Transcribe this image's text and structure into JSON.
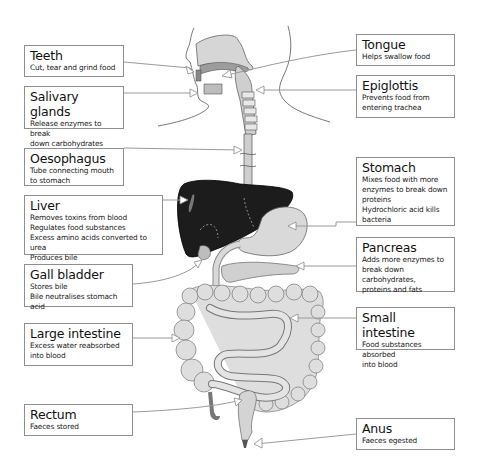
{
  "diagram": {
    "labels": [
      {
        "id": "teeth",
        "side": "left",
        "title": "Teeth",
        "description": [
          "Cut, tear and grind food"
        ],
        "box": {
          "x": 24,
          "y": 45,
          "w": 100,
          "h": 32
        }
      },
      {
        "id": "salivary-glands",
        "side": "left",
        "title": "Salivary glands",
        "description": [
          "Release enzymes to break",
          "down carbohydrates"
        ],
        "box": {
          "x": 24,
          "y": 86,
          "w": 100,
          "h": 43
        }
      },
      {
        "id": "oesophagus",
        "side": "left",
        "title": "Oesophagus",
        "description": [
          "Tube connecting mouth",
          "to stomach"
        ],
        "box": {
          "x": 24,
          "y": 148,
          "w": 100,
          "h": 38
        }
      },
      {
        "id": "liver",
        "side": "left",
        "title": "Liver",
        "description": [
          "Removes toxins from blood",
          "Regulates food substances",
          "Excess amino acids converted to urea",
          "Produces bile"
        ],
        "box": {
          "x": 24,
          "y": 195,
          "w": 139,
          "h": 60
        }
      },
      {
        "id": "gall-bladder",
        "side": "left",
        "title": "Gall bladder",
        "description": [
          "Stores bile",
          "Bile neutralises stomach acid"
        ],
        "box": {
          "x": 24,
          "y": 264,
          "w": 109,
          "h": 43
        }
      },
      {
        "id": "large-intestine",
        "side": "left",
        "title": "Large intestine",
        "description": [
          "Excess water reabsorbed",
          "into blood"
        ],
        "box": {
          "x": 24,
          "y": 323,
          "w": 109,
          "h": 43
        }
      },
      {
        "id": "rectum",
        "side": "left",
        "title": "Rectum",
        "description": [
          "Faeces stored"
        ],
        "box": {
          "x": 24,
          "y": 404,
          "w": 109,
          "h": 32
        }
      },
      {
        "id": "tongue",
        "side": "right",
        "title": "Tongue",
        "description": [
          "Helps swallow food"
        ],
        "box": {
          "x": 356,
          "y": 34,
          "w": 99,
          "h": 32
        }
      },
      {
        "id": "epiglottis",
        "side": "right",
        "title": "Epiglottis",
        "description": [
          "Prevents food from",
          "entering trachea"
        ],
        "box": {
          "x": 356,
          "y": 75,
          "w": 99,
          "h": 43
        }
      },
      {
        "id": "stomach",
        "side": "right",
        "title": "Stomach",
        "description": [
          "Mixes food with more",
          "enzymes to break down",
          "proteins",
          "Hydrochloric acid kills",
          "bacteria"
        ],
        "box": {
          "x": 356,
          "y": 157,
          "w": 99,
          "h": 69
        }
      },
      {
        "id": "pancreas",
        "side": "right",
        "title": "Pancreas",
        "description": [
          "Adds more enzymes to",
          "break down carbohydrates,",
          "proteins and fats"
        ],
        "box": {
          "x": 356,
          "y": 237,
          "w": 99,
          "h": 55
        }
      },
      {
        "id": "small-intestine",
        "side": "right",
        "title": "Small intestine",
        "description": [
          "Food substances absorbed",
          "into blood"
        ],
        "box": {
          "x": 356,
          "y": 307,
          "w": 99,
          "h": 43
        }
      },
      {
        "id": "anus",
        "side": "right",
        "title": "Anus",
        "description": [
          "Faeces egested"
        ],
        "box": {
          "x": 356,
          "y": 418,
          "w": 99,
          "h": 32
        }
      }
    ],
    "colors": {
      "liver": "#1c1c1c",
      "organ_fill": "#d9d9d9",
      "organ_stroke": "#6e6e6e",
      "box_border": "#8f8f8f",
      "pointer": "#9a9a9a"
    }
  }
}
